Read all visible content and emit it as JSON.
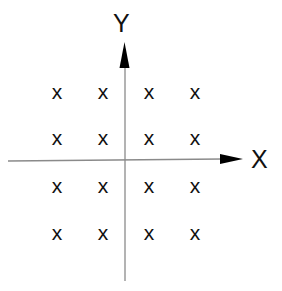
{
  "diagram": {
    "axes": {
      "x_label": "X",
      "y_label": "Y",
      "line_color": "#8a8a8a",
      "arrow_color": "#000000"
    },
    "grid": {
      "marker": "x",
      "columns": [
        57,
        103,
        149,
        195
      ],
      "rows": [
        93,
        139,
        187,
        234
      ]
    },
    "points": [
      {
        "label": "x",
        "col": 0,
        "row": 0
      },
      {
        "label": "x",
        "col": 1,
        "row": 0
      },
      {
        "label": "x",
        "col": 2,
        "row": 0
      },
      {
        "label": "x",
        "col": 3,
        "row": 0
      },
      {
        "label": "x",
        "col": 0,
        "row": 1
      },
      {
        "label": "x",
        "col": 1,
        "row": 1
      },
      {
        "label": "x",
        "col": 2,
        "row": 1
      },
      {
        "label": "x",
        "col": 3,
        "row": 1
      },
      {
        "label": "x",
        "col": 0,
        "row": 2
      },
      {
        "label": "x",
        "col": 1,
        "row": 2
      },
      {
        "label": "x",
        "col": 2,
        "row": 2
      },
      {
        "label": "x",
        "col": 3,
        "row": 2
      },
      {
        "label": "x",
        "col": 0,
        "row": 3
      },
      {
        "label": "x",
        "col": 1,
        "row": 3
      },
      {
        "label": "x",
        "col": 2,
        "row": 3
      },
      {
        "label": "x",
        "col": 3,
        "row": 3
      }
    ]
  }
}
